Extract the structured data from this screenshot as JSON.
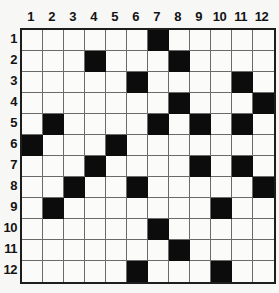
{
  "puzzle": {
    "title": "Crossword Grid",
    "type": "crossword-grid",
    "rows": 12,
    "columns": 12,
    "column_headers": [
      "1",
      "2",
      "3",
      "4",
      "5",
      "6",
      "7",
      "8",
      "9",
      "10",
      "11",
      "12"
    ],
    "row_headers": [
      "1",
      "2",
      "3",
      "4",
      "5",
      "6",
      "7",
      "8",
      "9",
      "10",
      "11",
      "12"
    ],
    "colors": {
      "white_cell": "#fbfbfa",
      "black_cell": "#0c0c0c",
      "grid_line": "#6b6b6b",
      "outer_border": "#1d1d1d",
      "page_background": "#f7f7f6",
      "label_text": "#131313"
    },
    "black_cells_by_row": {
      "1": [
        7
      ],
      "2": [
        4,
        8
      ],
      "3": [
        6,
        11
      ],
      "4": [
        8,
        12
      ],
      "5": [
        2,
        7,
        9,
        11
      ],
      "6": [
        1,
        5
      ],
      "7": [
        4,
        9,
        11
      ],
      "8": [
        3,
        6,
        12
      ],
      "9": [
        2,
        10
      ],
      "10": [
        7
      ],
      "11": [
        8
      ],
      "12": [
        6,
        10
      ]
    },
    "cells": [
      [
        0,
        0,
        0,
        0,
        0,
        0,
        1,
        0,
        0,
        0,
        0,
        0
      ],
      [
        0,
        0,
        0,
        1,
        0,
        0,
        0,
        1,
        0,
        0,
        0,
        0
      ],
      [
        0,
        0,
        0,
        0,
        0,
        1,
        0,
        0,
        0,
        0,
        1,
        0
      ],
      [
        0,
        0,
        0,
        0,
        0,
        0,
        0,
        1,
        0,
        0,
        0,
        1
      ],
      [
        0,
        1,
        0,
        0,
        0,
        0,
        1,
        0,
        1,
        0,
        1,
        0
      ],
      [
        1,
        0,
        0,
        0,
        1,
        0,
        0,
        0,
        0,
        0,
        0,
        0
      ],
      [
        0,
        0,
        0,
        1,
        0,
        0,
        0,
        0,
        1,
        0,
        1,
        0
      ],
      [
        0,
        0,
        1,
        0,
        0,
        1,
        0,
        0,
        0,
        0,
        0,
        1
      ],
      [
        0,
        1,
        0,
        0,
        0,
        0,
        0,
        0,
        0,
        1,
        0,
        0
      ],
      [
        0,
        0,
        0,
        0,
        0,
        0,
        1,
        0,
        0,
        0,
        0,
        0
      ],
      [
        0,
        0,
        0,
        0,
        0,
        0,
        0,
        1,
        0,
        0,
        0,
        0
      ],
      [
        0,
        0,
        0,
        0,
        0,
        1,
        0,
        0,
        0,
        1,
        0,
        0
      ]
    ],
    "total_black_cells": 26,
    "total_white_cells": 118
  }
}
